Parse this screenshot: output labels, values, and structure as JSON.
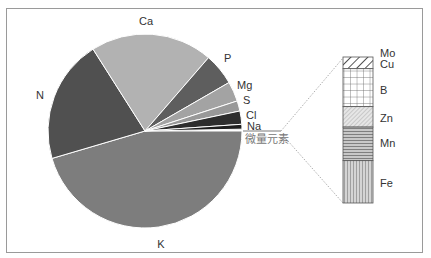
{
  "chart_data": [
    {
      "type": "pie",
      "title": "",
      "start_angle_deg": 0,
      "direction": "clockwise-from-3-oclock-downward",
      "slices": [
        {
          "label": "K",
          "value": 45.3,
          "color": "#7d7d7d"
        },
        {
          "label": "N",
          "value": 20.5,
          "color": "#505050"
        },
        {
          "label": "Ca",
          "value": 20.3,
          "color": "#b2b2b2"
        },
        {
          "label": "P",
          "value": 5.3,
          "color": "#5e5e5e"
        },
        {
          "label": "Mg",
          "value": 3.3,
          "color": "#a3a3a3"
        },
        {
          "label": "S",
          "value": 1.7,
          "color": "#999999"
        },
        {
          "label": "Cl",
          "value": 2.2,
          "color": "#2e2e2e"
        },
        {
          "label": "Na",
          "value": 0.8,
          "color": "#1e1e1e"
        },
        {
          "label": "微量元素",
          "value": 0.3,
          "color": "#ffffff"
        }
      ],
      "exploded_slice": "微量元素"
    },
    {
      "type": "bar",
      "subtype": "stacked-100",
      "title": "微量元素",
      "segments_top_to_bottom": [
        {
          "label": "Mo",
          "value": 1,
          "pattern": "diagonal-hatch"
        },
        {
          "label": "Cu",
          "value": 7,
          "pattern": "diagonal-hatch"
        },
        {
          "label": "B",
          "value": 26,
          "pattern": "grid"
        },
        {
          "label": "Zn",
          "value": 14,
          "pattern": "fine-diagonal"
        },
        {
          "label": "Mn",
          "value": 23,
          "pattern": "horizontal-lines"
        },
        {
          "label": "Fe",
          "value": 29,
          "pattern": "vertical-lines"
        }
      ]
    }
  ],
  "labels": {
    "K": "K",
    "N": "N",
    "Ca": "Ca",
    "P": "P",
    "Mg": "Mg",
    "S": "S",
    "Cl": "Cl",
    "Na": "Na",
    "trace": "微量元素",
    "Mo": "Mo",
    "Cu": "Cu",
    "B": "B",
    "Zn": "Zn",
    "Mn": "Mn",
    "Fe": "Fe"
  }
}
